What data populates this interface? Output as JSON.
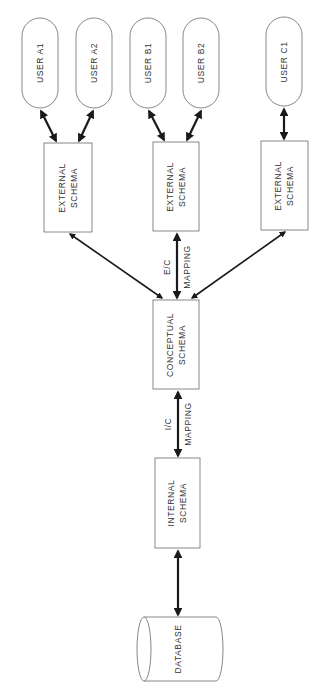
{
  "diagram": {
    "colors": {
      "line": "#6a6a6a",
      "arrow": "#1a1a1a",
      "text": "#333333",
      "background": "#ffffff"
    },
    "users": [
      {
        "id": "a1",
        "label": "USER A1"
      },
      {
        "id": "a2",
        "label": "USER A2"
      },
      {
        "id": "b1",
        "label": "USER B1"
      },
      {
        "id": "b2",
        "label": "USER B2"
      },
      {
        "id": "c1",
        "label": "USER C1"
      }
    ],
    "external_schemas": [
      {
        "id": "ext-a",
        "line1": "EXTERNAL",
        "line2": "SCHEMA"
      },
      {
        "id": "ext-b",
        "line1": "EXTERNAL",
        "line2": "SCHEMA"
      },
      {
        "id": "ext-c",
        "line1": "EXTERNAL",
        "line2": "SCHEMA"
      }
    ],
    "ec_mapping": {
      "line1": "E/C",
      "line2": "MAPPING"
    },
    "conceptual_schema": {
      "line1": "CONCEPTUAL",
      "line2": "SCHEMA"
    },
    "ic_mapping": {
      "line1": "I/C",
      "line2": "MAPPING"
    },
    "internal_schema": {
      "line1": "INTERNAL",
      "line2": "SCHEMA"
    },
    "database": {
      "label": "DATABASE"
    }
  }
}
